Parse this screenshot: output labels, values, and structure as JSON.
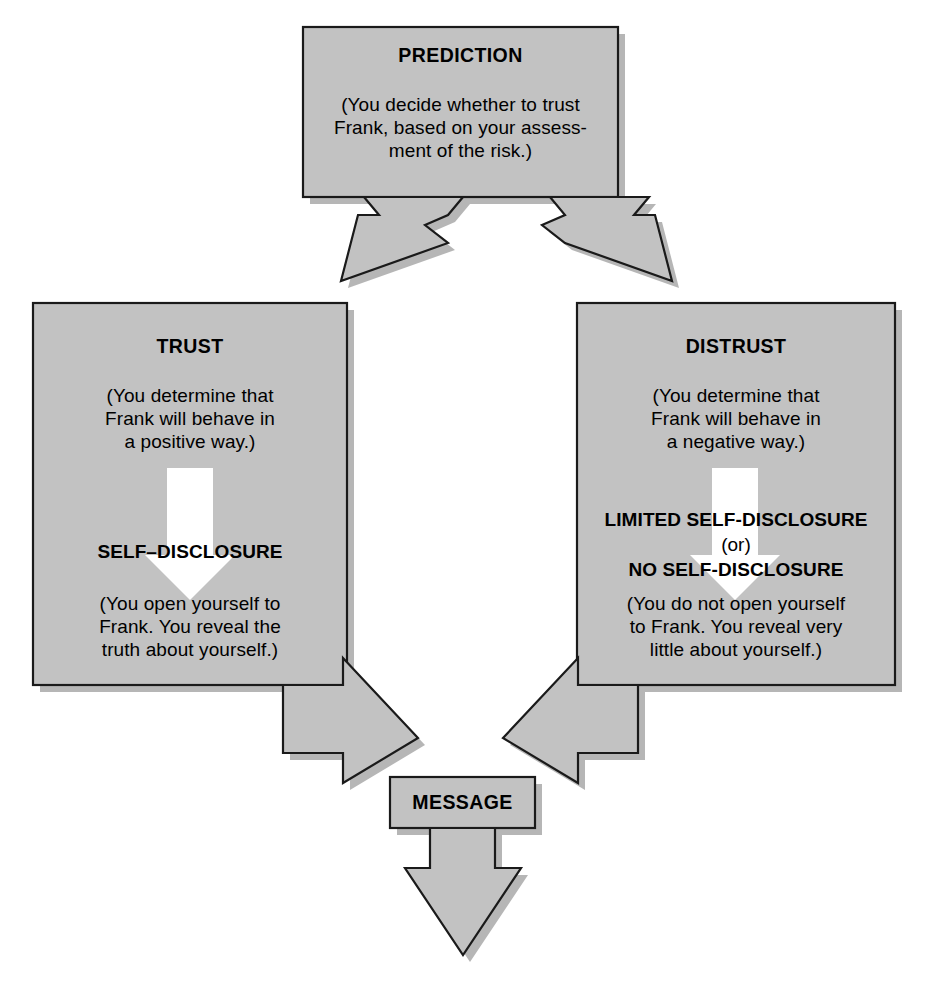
{
  "diagram": {
    "colors": {
      "box_fill": "#c2c2c2",
      "box_border": "#1a1a1a",
      "shadow": "#a9a9a9",
      "inner_arrow": "#ffffff",
      "page_background": "#ffffff",
      "text": "#000000"
    },
    "nodes": {
      "prediction": {
        "heading": "PREDICTION",
        "body_lines": [
          "(You decide whether to trust",
          "Frank, based on your assess-",
          "ment of the risk.)"
        ]
      },
      "trust": {
        "heading": "TRUST",
        "body_lines": [
          "(You determine that",
          "Frank will behave in",
          "a positive way.)"
        ],
        "outcome_heading": "SELF–DISCLOSURE",
        "outcome_lines": [
          "(You open yourself to",
          "Frank.  You reveal the",
          "truth about yourself.)"
        ]
      },
      "distrust": {
        "heading": "DISTRUST",
        "body_lines": [
          "(You determine that",
          "Frank will behave in",
          "a negative way.)"
        ],
        "outcome_heading_1": "LIMITED SELF-DISCLOSURE",
        "outcome_connector": "(or)",
        "outcome_heading_2": "NO SELF-DISCLOSURE",
        "outcome_lines": [
          "(You do not open yourself",
          "to Frank.  You reveal very",
          "little about yourself.)"
        ]
      },
      "message": {
        "heading": "MESSAGE"
      }
    },
    "connectors": [
      {
        "name": "prediction-fork-arrow",
        "from": "prediction",
        "to": [
          "trust",
          "distrust"
        ],
        "style": "split-arrow-down"
      },
      {
        "name": "trust-inner-arrow",
        "from": "trust-heading-block",
        "to": "trust-outcome-block",
        "style": "white-arrow-down"
      },
      {
        "name": "distrust-inner-arrow",
        "from": "distrust-heading-block",
        "to": "distrust-outcome-block",
        "style": "white-arrow-down"
      },
      {
        "name": "trust-to-message-arrow",
        "from": "trust",
        "to": "message",
        "style": "elbow-arrow-down-right"
      },
      {
        "name": "distrust-to-message-arrow",
        "from": "distrust",
        "to": "message",
        "style": "elbow-arrow-down-left"
      },
      {
        "name": "message-output-arrow",
        "from": "message",
        "to": "output",
        "style": "arrow-down"
      }
    ]
  }
}
